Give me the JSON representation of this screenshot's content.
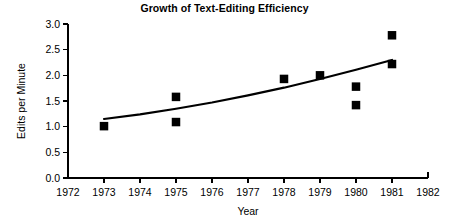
{
  "chart_data": {
    "type": "scatter",
    "title": "Growth of Text-Editing Efficiency",
    "xlabel": "Year",
    "ylabel": "Edits per Minute",
    "xlim": [
      1972,
      1982
    ],
    "ylim": [
      0.0,
      3.0
    ],
    "grid": false,
    "legend": null,
    "xticks": [
      1972,
      1973,
      1974,
      1975,
      1976,
      1977,
      1978,
      1979,
      1980,
      1981,
      1982
    ],
    "xtick_labels": [
      "1972",
      "1973",
      "1974",
      "1975",
      "1976",
      "1977",
      "1978",
      "1979",
      "1980",
      "1981",
      "1982"
    ],
    "yticks": [
      0.0,
      0.5,
      1.0,
      1.5,
      2.0,
      2.5,
      3.0
    ],
    "ytick_labels": [
      "0.0",
      "0.5",
      "1.0",
      "1.5",
      "2.0",
      "2.5",
      "3.0"
    ],
    "marker_style": "filled-square",
    "marker_color": "#000000",
    "line_color": "#000000",
    "points": [
      {
        "x": 1973,
        "y": 1.01
      },
      {
        "x": 1975,
        "y": 1.58
      },
      {
        "x": 1975,
        "y": 1.09
      },
      {
        "x": 1978,
        "y": 1.93
      },
      {
        "x": 1979,
        "y": 2.0
      },
      {
        "x": 1980,
        "y": 1.78
      },
      {
        "x": 1980,
        "y": 1.42
      },
      {
        "x": 1981,
        "y": 2.78
      },
      {
        "x": 1981,
        "y": 2.22
      }
    ],
    "trend": {
      "name": "fitted trend",
      "x": [
        1973.0,
        1974.0,
        1975.0,
        1976.0,
        1977.0,
        1978.0,
        1979.0,
        1980.0,
        1981.0
      ],
      "y": [
        1.15,
        1.24,
        1.35,
        1.47,
        1.61,
        1.76,
        1.93,
        2.11,
        2.3
      ]
    }
  },
  "geometry": {
    "x_axis_y": 178,
    "y_axis_x": 68,
    "x_left": 68,
    "x_right": 428,
    "y_top": 24,
    "y_bottom": 178
  }
}
